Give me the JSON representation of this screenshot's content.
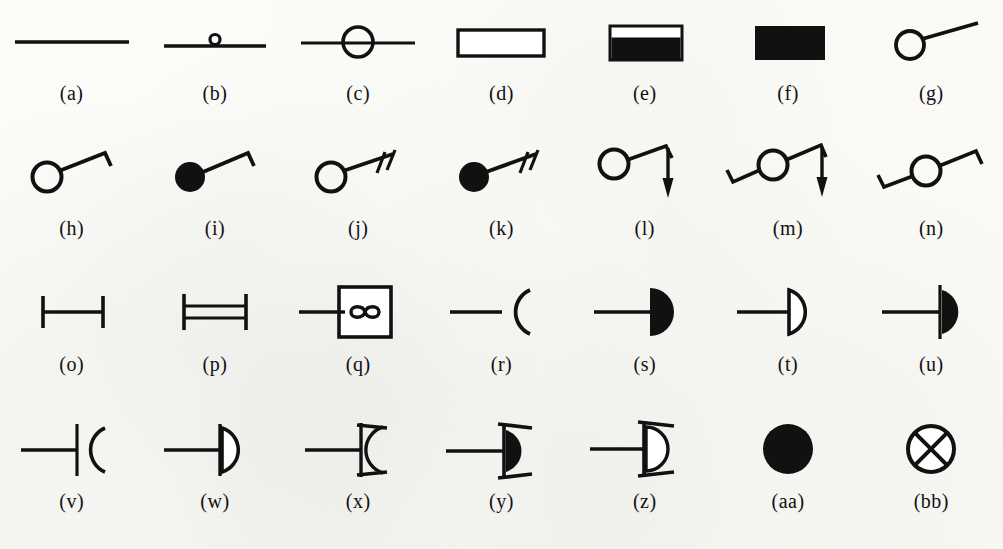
{
  "figure": {
    "background_color": "#fdfdfb",
    "ink_color": "#111111",
    "columns": 7,
    "rows": 4,
    "symbol_count": 28
  },
  "symbols": [
    {
      "id": "a",
      "caption": "(a)",
      "name": "plain-line",
      "description": "Single straight horizontal line"
    },
    {
      "id": "b",
      "caption": "(b)",
      "name": "line-with-small-circle",
      "description": "Horizontal line with a tiny open circle resting on top at its centre"
    },
    {
      "id": "c",
      "caption": "(c)",
      "name": "line-through-circle",
      "description": "Open circle with a horizontal line passing through it"
    },
    {
      "id": "d",
      "caption": "(d)",
      "name": "open-rectangle",
      "description": "Wide hollow rectangle, black outline, white fill"
    },
    {
      "id": "e",
      "caption": "(e)",
      "name": "half-filled-rectangle",
      "description": "Rectangle with narrow white band across the top and solid black below"
    },
    {
      "id": "f",
      "caption": "(f)",
      "name": "solid-rectangle",
      "description": "Solid black filled rectangle"
    },
    {
      "id": "g",
      "caption": "(g)",
      "name": "circle-with-straight-tail",
      "description": "Open circle with a straight tail running up to the right"
    },
    {
      "id": "h",
      "caption": "(h)",
      "name": "circle-with-hooked-tail",
      "description": "Open circle with a tail up to the right ending in a short downward hook"
    },
    {
      "id": "i",
      "caption": "(i)",
      "name": "filled-circle-with-hooked-tail",
      "description": "Solid black circle with a tail up to the right ending in a short downward hook"
    },
    {
      "id": "j",
      "caption": "(j)",
      "name": "circle-with-double-tick-tail",
      "description": "Open circle with a tail up to the right carrying two short cross ticks"
    },
    {
      "id": "k",
      "caption": "(k)",
      "name": "filled-circle-with-double-tick-tail",
      "description": "Solid black circle with a tail up to the right carrying two short cross ticks"
    },
    {
      "id": "l",
      "caption": "(l)",
      "name": "circle-tail-with-down-arrow",
      "description": "Open circle, tail up to the right to an apex, then a vertical arrow pointing down"
    },
    {
      "id": "m",
      "caption": "(m)",
      "name": "circle-two-tails-with-down-arrow",
      "description": "Open circle with a hooked tail to the lower left and a tail to the upper right ending in a down arrow"
    },
    {
      "id": "n",
      "caption": "(n)",
      "name": "circle-two-hooked-tails",
      "description": "Open circle with hooked tails on both the lower left and the upper right"
    },
    {
      "id": "o",
      "caption": "(o)",
      "name": "single-bar-with-end-ticks",
      "description": "Horizontal bar terminated by a short vertical tick at each end"
    },
    {
      "id": "p",
      "caption": "(p)",
      "name": "double-bar-with-end-ticks",
      "description": "Two parallel horizontal bars terminated by a vertical tick at each end"
    },
    {
      "id": "q",
      "caption": "(q)",
      "name": "box-with-infinity",
      "description": "Square outline enclosing an infinity symbol, with a line entering from the left"
    },
    {
      "id": "r",
      "caption": "(r)",
      "name": "line-with-open-arc",
      "description": "Horizontal line meeting an open arc that bows away to the right"
    },
    {
      "id": "s",
      "caption": "(s)",
      "name": "line-with-filled-half-disc",
      "description": "Horizontal line ending in a solid black half disc opening to the right"
    },
    {
      "id": "t",
      "caption": "(t)",
      "name": "line-with-open-half-disc",
      "description": "Horizontal line ending in a hollow outlined half disc opening to the right"
    },
    {
      "id": "u",
      "caption": "(u)",
      "name": "bar-with-filled-half-disc",
      "description": "Horizontal line crossing a vertical bar, with a solid black half disc to the right"
    },
    {
      "id": "v",
      "caption": "(v)",
      "name": "bar-with-open-arc",
      "description": "Horizontal line crossing a vertical bar, with an open arc bowing to the right"
    },
    {
      "id": "w",
      "caption": "(w)",
      "name": "bar-with-outlined-half-disc",
      "description": "Horizontal line crossing a vertical bar, with a hollow outlined half disc to the right"
    },
    {
      "id": "x",
      "caption": "(x)",
      "name": "bar-arc-with-wings",
      "description": "Vertical bar with an arc and diagonal wings splayed from its top and bottom"
    },
    {
      "id": "y",
      "caption": "(y)",
      "name": "bar-filled-half-disc-with-wings",
      "description": "Vertical bar with a solid black half disc and diagonal wings at top and bottom"
    },
    {
      "id": "z",
      "caption": "(z)",
      "name": "bar-outlined-half-disc-with-wings",
      "description": "Vertical bar with a hollow outlined half disc and diagonal wings at top and bottom"
    },
    {
      "id": "aa",
      "caption": "(aa)",
      "name": "solid-circle",
      "description": "Solid black filled circle"
    },
    {
      "id": "bb",
      "caption": "(bb)",
      "name": "crossed-circle",
      "description": "Open circle containing a diagonal cross, forming four wedge sectors"
    }
  ]
}
